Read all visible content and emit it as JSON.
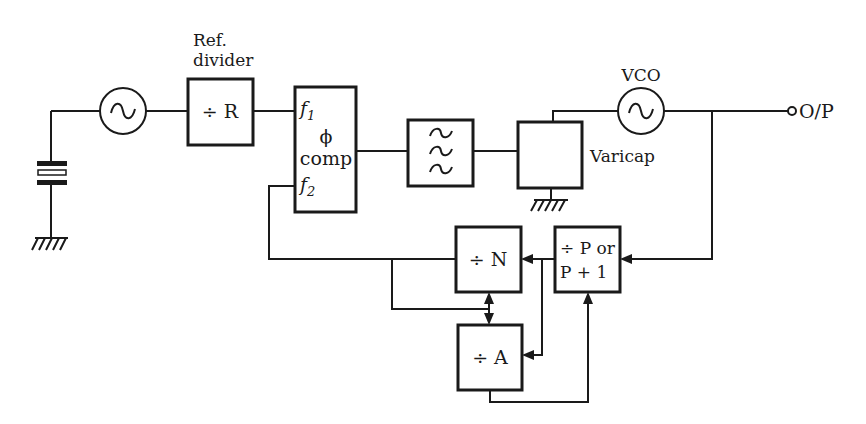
{
  "diagram": {
    "type": "block diagram",
    "labels": {
      "ref_divider_line1": "Ref.",
      "ref_divider_line2": "divider",
      "ref_divider_box": "÷ R",
      "phase_comp_f1": "f",
      "phase_comp_f1_sub": "1",
      "phase_comp_phi": "ϕ",
      "phase_comp_comp": "comp",
      "phase_comp_f2": "f",
      "phase_comp_f2_sub": "2",
      "vco": "VCO",
      "varicap": "Varicap",
      "output": "O/P",
      "divide_n": "÷ N",
      "divide_a": "÷ A",
      "prescaler_line1": "÷ P or",
      "prescaler_line2": "P + 1"
    },
    "blocks": [
      {
        "id": "crystal",
        "name": "Crystal"
      },
      {
        "id": "ref_osc",
        "name": "Reference oscillator",
        "icon": "sine-wave-icon"
      },
      {
        "id": "ref_divider",
        "name": "Ref. divider ÷ R"
      },
      {
        "id": "phase_comp",
        "name": "ϕ comp (phase comparator)"
      },
      {
        "id": "loop_filter",
        "name": "Loop filter",
        "icon": "lowpass-filter-icon"
      },
      {
        "id": "varicap",
        "name": "Varicap"
      },
      {
        "id": "vco",
        "name": "VCO",
        "icon": "sine-wave-icon"
      },
      {
        "id": "output",
        "name": "O/P"
      },
      {
        "id": "div_n",
        "name": "÷ N"
      },
      {
        "id": "div_a",
        "name": "÷ A"
      },
      {
        "id": "prescaler",
        "name": "÷ P or P + 1"
      }
    ],
    "connections": [
      [
        "crystal",
        "ref_osc"
      ],
      [
        "ref_osc",
        "ref_divider"
      ],
      [
        "ref_divider",
        "phase_comp.f1"
      ],
      [
        "phase_comp",
        "loop_filter"
      ],
      [
        "loop_filter",
        "varicap"
      ],
      [
        "varicap",
        "vco"
      ],
      [
        "vco",
        "output"
      ],
      [
        "vco",
        "prescaler"
      ],
      [
        "prescaler",
        "div_n"
      ],
      [
        "prescaler",
        "div_a"
      ],
      [
        "div_n",
        "phase_comp.f2"
      ],
      [
        "div_n",
        "div_a"
      ],
      [
        "div_a",
        "prescaler"
      ]
    ]
  }
}
